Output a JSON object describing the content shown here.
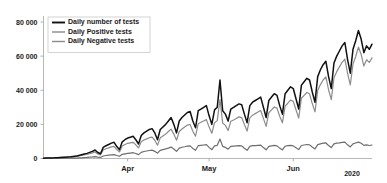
{
  "chart_data": {
    "type": "line",
    "title": "",
    "subtitle": "",
    "xlabel": "",
    "ylabel": "",
    "year_label": "2020",
    "ylim": [
      0,
      80000
    ],
    "yticks": [
      0,
      20000,
      40000,
      60000,
      80000
    ],
    "ytick_labels": [
      "0",
      "20 000",
      "40 000",
      "60 000",
      "80 000"
    ],
    "xticks": [
      "Apr",
      "May",
      "Jun"
    ],
    "xtick_labels": [
      "Apr",
      "May",
      "Jun"
    ],
    "grid": false,
    "legend_position": "upper left",
    "x_start": "2020-03-01",
    "x_end": "2020-06-30",
    "x": [
      "Mar 1",
      "Mar 2",
      "Mar 3",
      "Mar 4",
      "Mar 5",
      "Mar 6",
      "Mar 7",
      "Mar 8",
      "Mar 9",
      "Mar 10",
      "Mar 11",
      "Mar 12",
      "Mar 13",
      "Mar 14",
      "Mar 15",
      "Mar 16",
      "Mar 17",
      "Mar 18",
      "Mar 19",
      "Mar 20",
      "Mar 21",
      "Mar 22",
      "Mar 23",
      "Mar 24",
      "Mar 25",
      "Mar 26",
      "Mar 27",
      "Mar 28",
      "Mar 29",
      "Mar 30",
      "Mar 31",
      "Apr 1",
      "Apr 2",
      "Apr 3",
      "Apr 4",
      "Apr 5",
      "Apr 6",
      "Apr 7",
      "Apr 8",
      "Apr 9",
      "Apr 10",
      "Apr 11",
      "Apr 12",
      "Apr 13",
      "Apr 14",
      "Apr 15",
      "Apr 16",
      "Apr 17",
      "Apr 18",
      "Apr 19",
      "Apr 20",
      "Apr 21",
      "Apr 22",
      "Apr 23",
      "Apr 24",
      "Apr 25",
      "Apr 26",
      "Apr 27",
      "Apr 28",
      "Apr 29",
      "Apr 30",
      "May 1",
      "May 2",
      "May 3",
      "May 4",
      "May 5",
      "May 6",
      "May 7",
      "May 8",
      "May 9",
      "May 10",
      "May 11",
      "May 12",
      "May 13",
      "May 14",
      "May 15",
      "May 16",
      "May 17",
      "May 18",
      "May 19",
      "May 20",
      "May 21",
      "May 22",
      "May 23",
      "May 24",
      "May 25",
      "May 26",
      "May 27",
      "May 28",
      "May 29",
      "May 30",
      "May 31",
      "Jun 1",
      "Jun 2",
      "Jun 3",
      "Jun 4",
      "Jun 5",
      "Jun 6",
      "Jun 7",
      "Jun 8",
      "Jun 9",
      "Jun 10",
      "Jun 11",
      "Jun 12",
      "Jun 13",
      "Jun 14",
      "Jun 15",
      "Jun 16",
      "Jun 17",
      "Jun 18",
      "Jun 19",
      "Jun 20",
      "Jun 21",
      "Jun 22",
      "Jun 23",
      "Jun 24",
      "Jun 25",
      "Jun 26",
      "Jun 27",
      "Jun 28",
      "Jun 29",
      "Jun 30"
    ],
    "series": [
      {
        "name": "Daily number of tests",
        "color": "#111111",
        "width": 1.5,
        "values": [
          200,
          250,
          300,
          350,
          400,
          500,
          600,
          700,
          800,
          900,
          1000,
          1200,
          1400,
          1800,
          2200,
          2600,
          3000,
          3600,
          4200,
          5000,
          3500,
          2800,
          6500,
          7500,
          8200,
          9000,
          9500,
          7000,
          5200,
          9800,
          11000,
          12000,
          12500,
          13000,
          11000,
          8500,
          13500,
          15000,
          16000,
          17000,
          17500,
          15000,
          11000,
          17000,
          18500,
          20000,
          22000,
          24000,
          20000,
          15000,
          22000,
          24000,
          25500,
          27000,
          27500,
          22000,
          18000,
          28000,
          29000,
          30000,
          31000,
          25000,
          20000,
          28500,
          30000,
          46000,
          28000,
          26000,
          22000,
          29000,
          30000,
          31000,
          32000,
          31500,
          26000,
          21000,
          31000,
          33000,
          34000,
          35000,
          36000,
          30000,
          24000,
          34000,
          36000,
          38000,
          37000,
          31000,
          26000,
          38000,
          40000,
          42000,
          41000,
          35000,
          29000,
          43000,
          45000,
          47000,
          46000,
          39000,
          33000,
          48000,
          52000,
          55000,
          57000,
          48000,
          41000,
          56000,
          60000,
          63000,
          66000,
          68000,
          58000,
          50000,
          64000,
          69000,
          75000,
          70000,
          62000,
          66000,
          64000,
          67000
        ]
      },
      {
        "name": "Daily Negative tests",
        "color": "#8c8c8c",
        "width": 1.2,
        "values": [
          150,
          190,
          230,
          270,
          310,
          400,
          480,
          560,
          640,
          720,
          800,
          960,
          1120,
          1450,
          1750,
          2050,
          2350,
          2800,
          3250,
          3850,
          2700,
          2150,
          5000,
          5700,
          6200,
          6800,
          7100,
          5200,
          3850,
          7300,
          8200,
          8900,
          9200,
          9500,
          8000,
          6200,
          9800,
          10800,
          11500,
          12200,
          12500,
          10700,
          7800,
          12100,
          13200,
          14300,
          15800,
          17200,
          14300,
          10700,
          15800,
          17300,
          18500,
          19600,
          20000,
          16000,
          13100,
          20400,
          21200,
          22000,
          22800,
          18400,
          14800,
          21000,
          22200,
          34500,
          20800,
          19400,
          16400,
          21800,
          22600,
          23500,
          24400,
          24000,
          19900,
          16100,
          23800,
          25400,
          26300,
          27200,
          28100,
          23500,
          18800,
          26800,
          28500,
          30200,
          29500,
          24800,
          20900,
          30700,
          32400,
          34200,
          33500,
          28600,
          23700,
          35300,
          37000,
          38700,
          37900,
          32200,
          27300,
          39800,
          43300,
          46000,
          47800,
          40300,
          34500,
          47300,
          50900,
          53700,
          56400,
          58300,
          49900,
          43100,
          55300,
          59800,
          65300,
          61000,
          54200,
          57900,
          56300,
          59000
        ]
      },
      {
        "name": "Daily Positive tests",
        "color": "#6e6e6e",
        "width": 1.2,
        "values": [
          20,
          30,
          40,
          50,
          60,
          80,
          100,
          120,
          140,
          160,
          180,
          220,
          260,
          330,
          420,
          520,
          620,
          760,
          900,
          1100,
          760,
          620,
          1450,
          1750,
          1950,
          2150,
          2300,
          1750,
          1300,
          2450,
          2750,
          3000,
          3200,
          3400,
          2900,
          2250,
          3600,
          4100,
          4400,
          4700,
          4900,
          4200,
          3100,
          4800,
          5200,
          5600,
          6100,
          6700,
          5600,
          4200,
          6100,
          6600,
          6900,
          7300,
          7400,
          5900,
          4800,
          7500,
          7700,
          7900,
          8100,
          6500,
          5150,
          7400,
          7700,
          11400,
          7100,
          6500,
          5500,
          7100,
          7300,
          7400,
          7500,
          7400,
          6000,
          4800,
          7100,
          7500,
          7600,
          7700,
          7800,
          6400,
          5100,
          7100,
          7400,
          7700,
          7400,
          6100,
          5000,
          7200,
          7500,
          7700,
          7400,
          6300,
          5200,
          7600,
          7900,
          8200,
          8000,
          6700,
          5600,
          8100,
          8600,
          9000,
          9100,
          7600,
          6400,
          8600,
          9000,
          9200,
          9500,
          9600,
          8000,
          6800,
          8600,
          9100,
          9600,
          8900,
          7700,
          8000,
          7600,
          7900
        ]
      }
    ],
    "legend": [
      {
        "label": "Daily number of tests",
        "color": "#111111",
        "width": 1.9
      },
      {
        "label": "Daily Positive tests",
        "color": "#8a8a8a",
        "width": 1.4
      },
      {
        "label": "Daily Negative tests",
        "color": "#8a8a8a",
        "width": 1.4
      }
    ]
  }
}
